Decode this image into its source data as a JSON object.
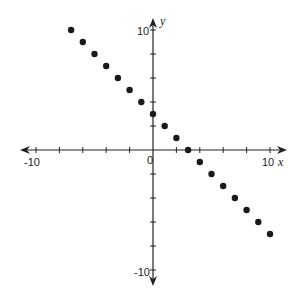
{
  "chart_data": {
    "type": "scatter",
    "title": "",
    "xlabel": "x",
    "ylabel": "y",
    "xlim": [
      -10,
      10
    ],
    "ylim": [
      -10,
      10
    ],
    "grid": false,
    "tick_step": 2,
    "tick_labels": {
      "x": [
        "-10",
        "0",
        "10"
      ],
      "y": [
        "10",
        "-10"
      ]
    },
    "series": [
      {
        "name": "points",
        "x": [
          -7,
          -6,
          -5,
          -4,
          -3,
          -2,
          -1,
          0,
          1,
          2,
          3,
          4,
          5,
          6,
          7,
          8,
          9,
          10
        ],
        "y": [
          10,
          9,
          8,
          7,
          6,
          5,
          4,
          3,
          2,
          1,
          0,
          -1,
          -2,
          -3,
          -4,
          -5,
          -6,
          -7
        ]
      }
    ]
  },
  "labels": {
    "x_min": "-10",
    "x_max": "10",
    "origin": "0",
    "y_max": "10",
    "y_min": "-10",
    "x_axis": "x",
    "y_axis": "y"
  },
  "colors": {
    "axis": "#222222",
    "point": "#1a1a1a"
  }
}
